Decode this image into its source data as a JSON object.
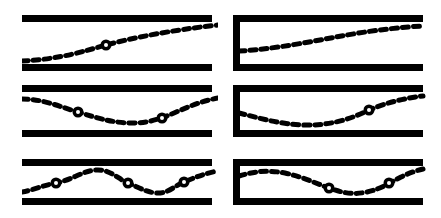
{
  "figure": {
    "stroke_color": "#000000",
    "background_color": "#ffffff",
    "fill_color": "#ffffff",
    "bar_thickness": 7,
    "dash_pattern": "6 5",
    "dash_width": 5,
    "node_outer_radius": 5.5,
    "node_inner_radius": 2.0,
    "grid": {
      "columns": 2,
      "rows": 3
    }
  },
  "panels": [
    {
      "id": "panel-open-mode-1",
      "name": "open-tube-mode-1",
      "column": "left",
      "row": 1,
      "end_condition": "open-open",
      "node_count": 1,
      "x": 22,
      "y": 15,
      "width": 196,
      "height": 56,
      "channel": {
        "top_y": 3.5,
        "bottom_y": 52.5,
        "left_x": 0,
        "right_x": 190,
        "closed_left": false
      },
      "wave_path": "M 0 46 C 40 44, 62 36, 84 30 C 110 23, 150 15, 196 10",
      "nodes": [
        {
          "x": 84,
          "y": 30
        }
      ]
    },
    {
      "id": "panel-closed-mode-1",
      "name": "closed-tube-mode-1",
      "column": "right",
      "row": 1,
      "end_condition": "closed-open",
      "node_count": 0,
      "x": 233,
      "y": 15,
      "width": 196,
      "height": 56,
      "channel": {
        "top_y": 3.5,
        "bottom_y": 52.5,
        "left_x": 3.5,
        "right_x": 190,
        "closed_left": true
      },
      "wave_path": "M 6 36 C 44 34, 80 26, 114 20 C 142 15, 170 12, 190 11",
      "nodes": []
    },
    {
      "id": "panel-open-mode-2",
      "name": "open-tube-mode-2",
      "column": "left",
      "row": 2,
      "end_condition": "open-open",
      "node_count": 2,
      "x": 22,
      "y": 85,
      "width": 196,
      "height": 54,
      "channel": {
        "top_y": 3.5,
        "bottom_y": 48.5,
        "left_x": 0,
        "right_x": 190,
        "closed_left": false
      },
      "wave_path": "M 0 14 C 22 14, 38 22, 56 27 C 78 34, 92 38, 110 38 C 128 38, 140 33, 152 28 C 168 21, 180 16, 196 13",
      "nodes": [
        {
          "x": 56,
          "y": 27
        },
        {
          "x": 140,
          "y": 33
        }
      ]
    },
    {
      "id": "panel-closed-mode-2",
      "name": "closed-tube-mode-2",
      "column": "right",
      "row": 2,
      "end_condition": "closed-open",
      "node_count": 1,
      "x": 233,
      "y": 85,
      "width": 196,
      "height": 54,
      "channel": {
        "top_y": 3.5,
        "bottom_y": 48.5,
        "left_x": 3.5,
        "right_x": 190,
        "closed_left": true
      },
      "wave_path": "M 6 28 C 26 33, 46 39, 70 40 C 96 41, 118 34, 136 25 C 152 18, 172 13, 190 11",
      "nodes": [
        {
          "x": 136,
          "y": 25
        }
      ]
    },
    {
      "id": "panel-open-mode-3",
      "name": "open-tube-mode-3",
      "column": "left",
      "row": 3,
      "end_condition": "open-open",
      "node_count": 3,
      "x": 22,
      "y": 159,
      "width": 196,
      "height": 48,
      "channel": {
        "top_y": 3.5,
        "bottom_y": 42.5,
        "left_x": 0,
        "right_x": 190,
        "closed_left": false
      },
      "wave_path": "M 0 33 C 12 31, 22 26, 34 24 C 50 21, 60 12, 74 11 C 88 10, 96 20, 106 24 C 118 29, 124 33, 134 34 C 146 35, 152 27, 162 23 C 174 18, 184 14, 196 12",
      "nodes": [
        {
          "x": 34,
          "y": 24
        },
        {
          "x": 106,
          "y": 24
        },
        {
          "x": 162,
          "y": 23
        }
      ]
    },
    {
      "id": "panel-closed-mode-3",
      "name": "closed-tube-mode-3",
      "column": "right",
      "row": 3,
      "end_condition": "closed-open",
      "node_count": 2,
      "x": 233,
      "y": 159,
      "width": 196,
      "height": 48,
      "channel": {
        "top_y": 3.5,
        "bottom_y": 42.5,
        "left_x": 3.5,
        "right_x": 190,
        "closed_left": true
      },
      "wave_path": "M 6 17 C 22 12, 36 11, 52 14 C 70 18, 82 24, 96 29 C 110 34, 120 36, 134 33 C 148 30, 156 24, 168 18 C 178 13, 186 11, 190 10",
      "nodes": [
        {
          "x": 96,
          "y": 29
        },
        {
          "x": 156,
          "y": 24
        }
      ]
    }
  ]
}
